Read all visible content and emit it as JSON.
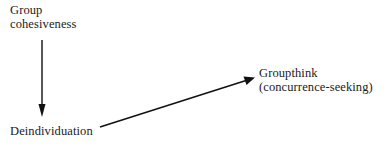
{
  "diagram": {
    "nodes": [
      {
        "id": "cohesion",
        "lines": [
          "Group",
          "cohesiveness"
        ]
      },
      {
        "id": "deindividuation",
        "lines": [
          "Deindividuation"
        ]
      },
      {
        "id": "groupthink",
        "lines": [
          "Groupthink",
          "(concurrence-seeking)"
        ]
      }
    ],
    "edges": [
      {
        "from": "cohesion",
        "to": "deindividuation",
        "direction": "down"
      },
      {
        "from": "deindividuation",
        "to": "groupthink",
        "direction": "up-right"
      }
    ],
    "colors": {
      "text": "#1a1a1a",
      "line": "#111111",
      "background": "#ffffff"
    }
  }
}
